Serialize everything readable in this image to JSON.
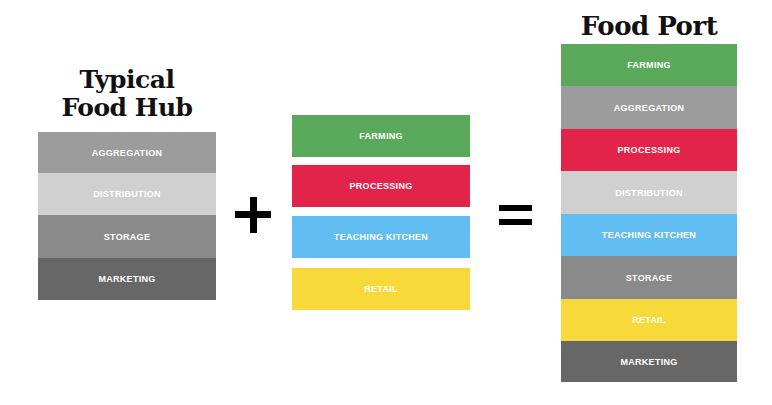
{
  "left": {
    "title_line1": "Typical",
    "title_line2": "Food Hub",
    "bands": [
      {
        "label": "AGGREGATION",
        "color": "#9c9c9c"
      },
      {
        "label": "DISTRIBUTION",
        "color": "#d0d0d0"
      },
      {
        "label": "STORAGE",
        "color": "#8a8a8a"
      },
      {
        "label": "MARKETING",
        "color": "#676767"
      }
    ]
  },
  "middle": {
    "bands": [
      {
        "label": "FARMING",
        "color": "#5aa85a"
      },
      {
        "label": "PROCESSING",
        "color": "#e2234a"
      },
      {
        "label": "TEACHING KITCHEN",
        "color": "#62bdf2"
      },
      {
        "label": "RETAIL",
        "color": "#f7d93a"
      }
    ]
  },
  "operators": {
    "plus": "plus-icon",
    "equals": "equals-icon"
  },
  "right": {
    "title": "Food Port",
    "bands": [
      {
        "label": "FARMING",
        "color": "#5aa85a"
      },
      {
        "label": "AGGREGATION",
        "color": "#9c9c9c"
      },
      {
        "label": "PROCESSING",
        "color": "#e2234a"
      },
      {
        "label": "DISTRIBUTION",
        "color": "#d0d0d0"
      },
      {
        "label": "TEACHING KITCHEN",
        "color": "#62bdf2"
      },
      {
        "label": "STORAGE",
        "color": "#8a8a8a"
      },
      {
        "label": "RETAIL",
        "color": "#f7d93a"
      },
      {
        "label": "MARKETING",
        "color": "#676767"
      }
    ]
  }
}
